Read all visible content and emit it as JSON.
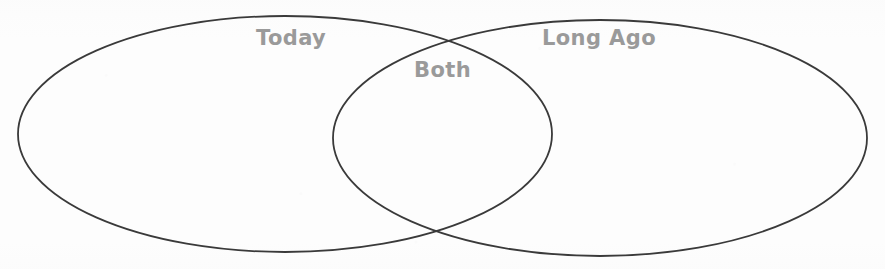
{
  "page": {
    "background_color": "#fdfdfd",
    "width": 885,
    "height": 269
  },
  "diagram": {
    "type": "venn",
    "set_count": 2,
    "stroke_color": "#3a3a3a",
    "stroke_width": 1.8,
    "label_color": "#9a9a9a",
    "left_set": {
      "label": "Today",
      "center_x": 285,
      "center_y": 134,
      "radius_x": 267,
      "radius_y": 118,
      "label_x": 256,
      "label_y": 28
    },
    "right_set": {
      "label": "Long Ago",
      "center_x": 600,
      "center_y": 138,
      "radius_x": 267,
      "radius_y": 118,
      "label_x": 542,
      "label_y": 28
    },
    "intersection": {
      "label": "Both",
      "label_x": 414,
      "label_y": 60,
      "upper_point_x": 443,
      "upper_point_y": 42,
      "lower_point_x": 443,
      "lower_point_y": 235
    },
    "regions": [
      {
        "name": "today-only",
        "label": "Today",
        "contents": []
      },
      {
        "name": "both",
        "label": "Both",
        "contents": []
      },
      {
        "name": "long-ago-only",
        "label": "Long Ago",
        "contents": []
      }
    ]
  }
}
